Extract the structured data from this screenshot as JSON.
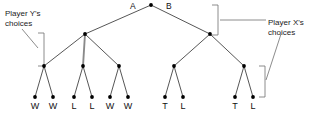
{
  "diagram": {
    "root": {
      "label": "",
      "x": 151,
      "y": 5
    },
    "edge_labels": [
      {
        "name": "edge-label-a",
        "text": "A",
        "x": 130,
        "y": 1
      },
      {
        "name": "edge-label-b",
        "text": "B",
        "x": 166,
        "y": 1
      }
    ],
    "annotations": [
      {
        "name": "player-y-annotation",
        "line1": "Player Y's",
        "line2": "choices",
        "side": "left"
      },
      {
        "name": "player-x-annotation",
        "line1": "Player X's",
        "line2": "choices",
        "side": "right"
      }
    ],
    "nodes": {
      "depth1": [
        {
          "id": "n-a",
          "x": 85,
          "y": 34
        },
        {
          "id": "n-b",
          "x": 210,
          "y": 34
        }
      ],
      "depth2": [
        {
          "id": "n-a1",
          "x": 44,
          "y": 66
        },
        {
          "id": "n-a2",
          "x": 83,
          "y": 66
        },
        {
          "id": "n-a3",
          "x": 119,
          "y": 66
        },
        {
          "id": "n-b1",
          "x": 174,
          "y": 66
        },
        {
          "id": "n-b2",
          "x": 244,
          "y": 66
        }
      ]
    },
    "leaves": [
      {
        "id": "leaf-1",
        "label": "W",
        "x": 35,
        "y": 97
      },
      {
        "id": "leaf-2",
        "label": "W",
        "x": 53,
        "y": 97
      },
      {
        "id": "leaf-3",
        "label": "L",
        "x": 74,
        "y": 97
      },
      {
        "id": "leaf-4",
        "label": "L",
        "x": 92,
        "y": 97
      },
      {
        "id": "leaf-5",
        "label": "W",
        "x": 110,
        "y": 97
      },
      {
        "id": "leaf-6",
        "label": "W",
        "x": 128,
        "y": 97
      },
      {
        "id": "leaf-7",
        "label": "T",
        "x": 165,
        "y": 97
      },
      {
        "id": "leaf-8",
        "label": "L",
        "x": 183,
        "y": 97
      },
      {
        "id": "leaf-9",
        "label": "T",
        "x": 235,
        "y": 97
      },
      {
        "id": "leaf-10",
        "label": "L",
        "x": 253,
        "y": 97
      }
    ],
    "colors": {
      "node": "#000000",
      "edge": "#2b2b2b",
      "highlight_edge": "#8a8a8a",
      "bracket": "#6e6e6e",
      "text": "#111111",
      "background": "#ffffff"
    }
  }
}
